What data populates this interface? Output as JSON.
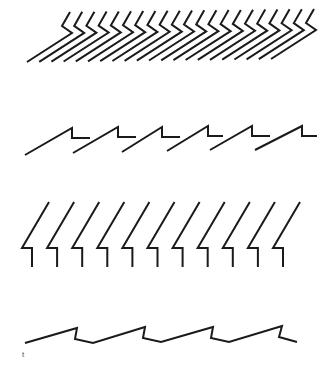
{
  "figure": {
    "stroke_color": "#1a1a1a",
    "background": "#ffffff",
    "caption": "t"
  },
  "rows": [
    {
      "name": "row-1-chevron-strokes",
      "count": 21,
      "unit_path": [
        [
          70,
          12
        ],
        [
          62,
          26
        ],
        [
          72,
          33
        ],
        [
          27,
          62
        ]
      ],
      "step": [
        12.2,
        -0.15
      ]
    },
    {
      "name": "row-2-sawtooth-step",
      "count": 6,
      "units": [
        [
          [
            25,
            155
          ],
          [
            72,
            128
          ],
          [
            72,
            138
          ],
          [
            90,
            138
          ]
        ],
        [
          [
            73,
            153
          ],
          [
            118,
            127
          ],
          [
            118,
            137
          ],
          [
            136,
            137
          ]
        ],
        [
          [
            122,
            152
          ],
          [
            162,
            127
          ],
          [
            162,
            137
          ],
          [
            180,
            137
          ]
        ],
        [
          [
            167,
            151
          ],
          [
            208,
            126
          ],
          [
            208,
            136
          ],
          [
            223,
            136
          ]
        ],
        [
          [
            210,
            150
          ],
          [
            252,
            126
          ],
          [
            252,
            136
          ],
          [
            270,
            136
          ]
        ],
        [
          [
            255,
            150
          ],
          [
            302,
            126
          ],
          [
            302,
            136
          ],
          [
            317,
            136
          ]
        ]
      ]
    },
    {
      "name": "row-3-lightning-glyphs",
      "count": 11,
      "unit_path": [
        [
          49,
          202
        ],
        [
          22,
          248
        ],
        [
          32,
          248
        ],
        [
          32,
          267
        ]
      ],
      "step": [
        25.1,
        0
      ]
    },
    {
      "name": "row-4-continuous-wave",
      "points": [
        [
          25,
          343
        ],
        [
          77,
          328
        ],
        [
          75,
          339
        ],
        [
          93,
          343
        ],
        [
          145,
          327
        ],
        [
          143,
          338
        ],
        [
          161,
          342
        ],
        [
          213,
          327
        ],
        [
          211,
          338
        ],
        [
          229,
          342
        ],
        [
          282,
          326
        ],
        [
          279,
          337
        ],
        [
          297,
          342
        ]
      ]
    }
  ]
}
